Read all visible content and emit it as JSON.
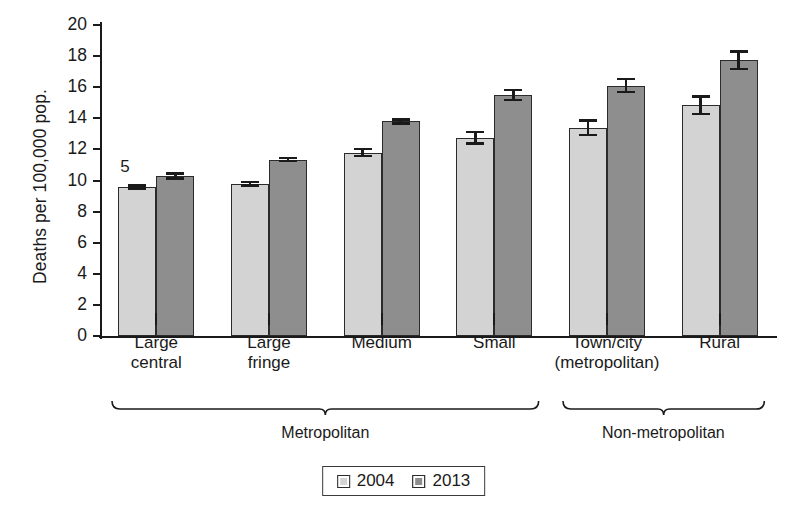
{
  "chart_data": {
    "type": "bar",
    "title": "",
    "xlabel": "",
    "ylabel": "Deaths per 100,000 pop.",
    "ylim": [
      0,
      20
    ],
    "yticks": [
      0,
      2,
      4,
      6,
      8,
      10,
      12,
      14,
      16,
      18,
      20
    ],
    "grid": false,
    "legend_position": "bottom-center",
    "categories": [
      "Large\ncentral",
      "Large\nfringe",
      "Medium",
      "Small",
      "Town/city\n(metropolitan)",
      "Rural"
    ],
    "series": [
      {
        "name": "2004",
        "color": "#d3d3d3",
        "values": [
          9.6,
          9.8,
          11.8,
          12.75,
          13.4,
          14.85
        ],
        "errors": [
          0.18,
          0.2,
          0.3,
          0.45,
          0.55,
          0.65
        ]
      },
      {
        "name": "2013",
        "color": "#8e8e8e",
        "values": [
          10.3,
          11.35,
          13.8,
          15.5,
          16.1,
          17.75
        ],
        "errors": [
          0.25,
          0.18,
          0.2,
          0.4,
          0.5,
          0.65
        ]
      }
    ],
    "annotations": [
      {
        "text": "5",
        "target": "Large central 2004 bar",
        "note": "footnote marker"
      }
    ],
    "group_brackets": [
      {
        "label": "Metropolitan",
        "categories": [
          "Large central",
          "Large fringe",
          "Medium",
          "Small"
        ]
      },
      {
        "label": "Non-metropolitan",
        "categories": [
          "Town/city (metropolitan)",
          "Rural"
        ]
      }
    ]
  },
  "legend": {
    "items": [
      {
        "label": "2004"
      },
      {
        "label": "2013"
      }
    ]
  }
}
